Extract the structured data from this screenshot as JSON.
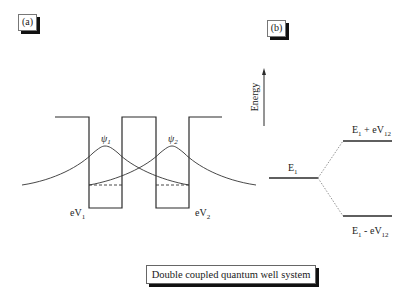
{
  "panels": {
    "a": {
      "label": "(a)"
    },
    "b": {
      "label": "(b)"
    }
  },
  "caption": "Double coupled quantum well system",
  "panel_a": {
    "wavefunctions": [
      {
        "name": "psi1",
        "label_base": "ψ",
        "label_sub": "1"
      },
      {
        "name": "psi2",
        "label_base": "ψ",
        "label_sub": "2"
      }
    ],
    "well_depths": [
      {
        "base": "eV",
        "sub": "1"
      },
      {
        "base": "eV",
        "sub": "2"
      }
    ]
  },
  "panel_b": {
    "axis_label": "Energy",
    "levels": {
      "single": {
        "base": "E",
        "sub": "1"
      },
      "upper": {
        "base": "E",
        "sub1": "1",
        "op": " + eV",
        "sub2": "12"
      },
      "lower": {
        "base": "E",
        "sub1": "1",
        "op": " - eV",
        "sub2": "12"
      }
    }
  },
  "colors": {
    "line": "#2a2a2a",
    "dotted": "#888888",
    "shadow": "#111111"
  }
}
